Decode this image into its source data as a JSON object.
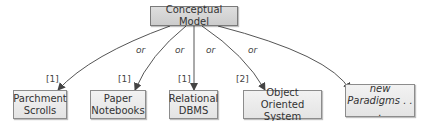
{
  "root": {
    "label": "Conceptual Model"
  },
  "edge_label": "or",
  "children": [
    {
      "label_line1": "Parchment",
      "label_line2": "Scrolls",
      "ref": "[1]"
    },
    {
      "label_line1": "Paper",
      "label_line2": "Notebooks",
      "ref": "[1]"
    },
    {
      "label_line1": "Relational",
      "label_line2": "DBMS",
      "ref": "[1]"
    },
    {
      "label_line1": "Object Oriented",
      "label_line2": "System",
      "ref": "[2]"
    },
    {
      "label_line1": "new",
      "label_line2": "Paradigms . . ."
    }
  ]
}
